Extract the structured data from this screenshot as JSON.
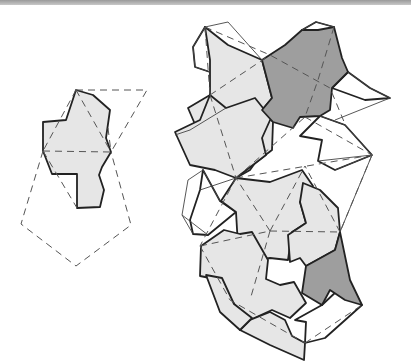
{
  "figure": {
    "type": "geometric-tiling-diagram",
    "colors": {
      "tile_light": "#e6e6e6",
      "tile_dark": "#9e9e9e",
      "outline": "#222222",
      "construction": "#555555",
      "top_bar": "#9a9a9a"
    },
    "left_figure": {
      "tile": "M76,90 L93,95 L110,110 L106,138 L111,152 L102,167 L99,175 L104,190 L100,207 L77,208 L77,174 L52,174 L43,151 L43,122 L66,120 Z",
      "dashed": [
        "M76,90 L147,90 L111,152",
        "M76,90 L111,152",
        "M43,151 L111,152",
        "M76,90 L43,151",
        "M43,151 L21,224 L76,266 L131,225 L111,152",
        "M43,151 L77,208",
        "M108,128 L111,152"
      ]
    },
    "right_figure": {
      "light_tiles": [
        "M205,27 L228,45 L262,60 L272,98 L262,110 L273,122 L272,150 L255,163 L250,170 L236,178 L238,154 L222,152 L220,130 L200,136 L188,108 L210,95 L210,60 Z",
        "M210,95 L226,108 L255,98 L271,118 L262,138 L266,155 L236,178 L215,170 L190,165 L175,132 L200,120 Z",
        "M236,178 L270,182 L302,170 L313,186 L300,202 L306,223 L292,232 L288,260 L270,258 L247,262 L238,246 L236,212 L221,201 Z",
        "M201,246 L224,230 L240,234 L252,232 L268,260 L266,279 L280,285 L294,282 L306,303 L290,318 L272,310 L250,320 L232,302 L218,300 L220,280 L200,276 Z",
        "M303,183 L320,190 L338,208 L340,232 L335,250 L306,266 L300,258 L290,262 L288,235 L306,223 L300,202 Z",
        "M250,320 L270,312 L285,320 L292,336 L305,343 L304,360 L270,345 L240,330 Z",
        "M206,275 L222,278 L234,304 L252,318 L240,330 L220,312 Z"
      ],
      "dark_tiles": [
        "M262,60 L285,45 L302,30 L318,30 L334,27 L342,58 L348,72 L332,88 L330,110 L320,116 L300,117 L293,128 L273,122 L262,110 L272,98 Z",
        "M340,232 L350,280 L362,305 L345,300 L330,290 L322,305 L302,293 L306,266 L335,250 Z"
      ],
      "white_tiles": [
        "M205,27 L193,47 L195,67 L210,72 L222,56 Z",
        "M302,30 L316,22 L334,27 L318,40 L308,48 Z",
        "M348,72 L370,88 L390,98 L365,100 L332,88 Z",
        "M320,116 L345,125 L372,155 L335,170 L318,161 L322,140 L300,136 Z",
        "M203,170 L220,201 L236,212 L208,235 L193,234 L190,220 L200,190 Z",
        "M322,305 L338,290 L362,305 L325,338 L305,343 L306,322 L295,320 Z"
      ],
      "thin_lines": [
        "M205,27 L228,22 L262,60",
        "M205,27 L193,47 L195,67 L210,72",
        "M302,30 L316,22 L334,27",
        "M348,72 L370,88 L390,98 L335,120",
        "M320,116 L345,125 L372,155 L335,170",
        "M318,161 L372,155",
        "M203,170 L188,180 L182,215 L193,234",
        "M182,215 L208,235",
        "M200,190 L236,178",
        "M203,170 L220,201",
        "M226,108 L190,130 L175,135",
        "M372,155 L340,232"
      ],
      "dashed": [
        "M205,27 L270,55 L330,88 L345,124",
        "M205,27 L210,95",
        "M210,95 L270,55",
        "M210,95 L236,178",
        "M334,27 L318,80 L305,117",
        "M305,117 L372,155",
        "M236,178 L372,155",
        "M236,178 L305,117",
        "M236,178 L200,246",
        "M200,246 L270,231",
        "M270,231 L340,232",
        "M270,231 L236,178",
        "M270,231 L305,166",
        "M270,231 L250,300",
        "M200,246 L230,300 L305,343",
        "M305,343 L362,305",
        "M340,232 L305,166",
        "M372,155 L340,232"
      ]
    }
  }
}
